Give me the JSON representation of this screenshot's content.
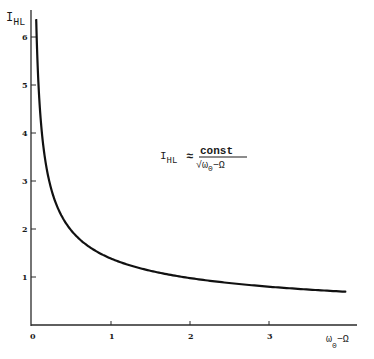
{
  "chart_data": {
    "type": "line",
    "title": "",
    "xlabel": "ω0−Ω",
    "ylabel": "I_HL",
    "xlim": [
      0,
      4
    ],
    "ylim": [
      0,
      6.4
    ],
    "x_ticks": [
      "0",
      "1",
      "2",
      "3"
    ],
    "y_ticks": [
      "1",
      "2",
      "3",
      "4",
      "5",
      "6"
    ],
    "grid": false,
    "legend": null,
    "annotation": {
      "lhs_main": "I",
      "lhs_sub": "HL",
      "approx": "≈",
      "numerator": "const",
      "denominator_main": "ω",
      "denominator_sub": "0",
      "denominator_rest": "−Ω",
      "sqrt": "√"
    },
    "series": [
      {
        "name": "I_HL ≈ const/√(ω0−Ω)",
        "x": [
          0.05,
          0.1,
          0.2,
          0.3,
          0.5,
          0.75,
          1.0,
          1.5,
          2.0,
          2.5,
          3.0,
          3.5,
          3.96
        ],
        "y": [
          6.2,
          4.4,
          3.1,
          2.55,
          1.98,
          1.62,
          1.4,
          1.14,
          0.99,
          0.89,
          0.81,
          0.75,
          0.69
        ]
      }
    ]
  },
  "axes": {
    "y_label_main": "I",
    "y_label_sub": "HL",
    "x_label_main": "ω",
    "x_label_sub": "0",
    "x_label_rest": "−Ω"
  }
}
